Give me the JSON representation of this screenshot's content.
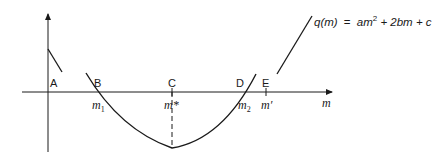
{
  "diagram": {
    "title_formula": {
      "lhs": "q(m)",
      "eq": "=",
      "rhs_parts": [
        "am",
        "2",
        " + 2bm + c"
      ]
    },
    "axis": {
      "x_label": "m"
    },
    "points": [
      {
        "id": "A",
        "label": "A"
      },
      {
        "id": "B",
        "label": "B",
        "m_label": "m",
        "m_sub": "1"
      },
      {
        "id": "C",
        "label": "C",
        "m_label": "m*"
      },
      {
        "id": "D",
        "label": "D",
        "m_label": "m",
        "m_sub": "2"
      },
      {
        "id": "E",
        "label": "E",
        "m_label": "m′"
      }
    ],
    "colors": {
      "stroke": "#1a1a1a",
      "background": "#ffffff"
    }
  }
}
